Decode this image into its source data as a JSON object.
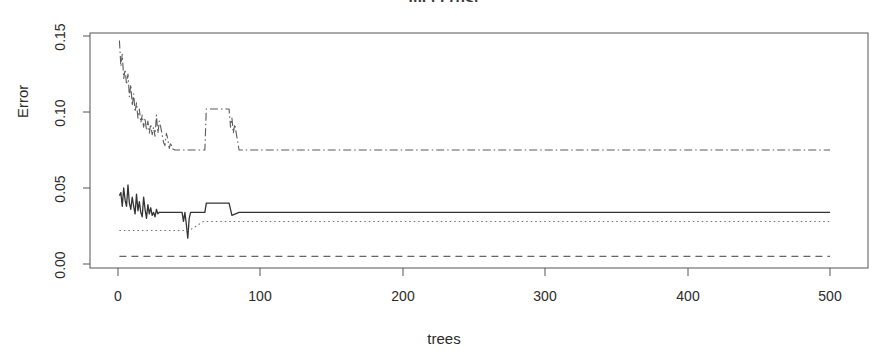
{
  "chart_data": {
    "type": "line",
    "title": "mcl.crbst",
    "xlabel": "trees",
    "ylabel": "Error",
    "xlim": [
      0,
      500
    ],
    "ylim": [
      0.0,
      0.155
    ],
    "xticks": [
      0,
      100,
      200,
      300,
      400,
      500
    ],
    "xtick_labels": [
      "0",
      "100",
      "200",
      "300",
      "400",
      "500"
    ],
    "yticks": [
      0.0,
      0.05,
      0.1,
      0.15
    ],
    "ytick_labels": [
      "0.00",
      "0.05",
      "0.10",
      "0.15"
    ],
    "grid": false,
    "legend": "none",
    "box": true,
    "series": [
      {
        "name": "OOB",
        "style": "solid",
        "color": "#333333",
        "x": [
          1,
          2,
          3,
          4,
          5,
          6,
          7,
          8,
          9,
          10,
          11,
          12,
          13,
          14,
          15,
          16,
          17,
          18,
          19,
          20,
          21,
          22,
          23,
          24,
          25,
          26,
          27,
          28,
          29,
          30,
          31,
          32,
          33,
          34,
          35,
          36,
          37,
          38,
          39,
          40,
          41,
          42,
          43,
          44,
          45,
          46,
          47,
          48,
          49,
          50,
          51,
          52,
          53,
          54,
          55,
          56,
          57,
          58,
          59,
          60,
          61,
          62,
          63,
          64,
          65,
          66,
          67,
          68,
          69,
          70,
          72,
          74,
          76,
          78,
          80,
          85,
          90,
          100,
          120,
          150,
          200,
          250,
          300,
          350,
          400,
          450,
          500
        ],
        "values": [
          0.045,
          0.047,
          0.038,
          0.05,
          0.042,
          0.038,
          0.052,
          0.04,
          0.036,
          0.044,
          0.038,
          0.033,
          0.046,
          0.035,
          0.041,
          0.034,
          0.031,
          0.044,
          0.036,
          0.03,
          0.039,
          0.033,
          0.037,
          0.032,
          0.034,
          0.031,
          0.036,
          0.033,
          0.034,
          0.034,
          0.034,
          0.034,
          0.034,
          0.034,
          0.034,
          0.034,
          0.034,
          0.034,
          0.034,
          0.034,
          0.034,
          0.034,
          0.034,
          0.034,
          0.034,
          0.028,
          0.034,
          0.026,
          0.017,
          0.03,
          0.034,
          0.034,
          0.034,
          0.034,
          0.034,
          0.034,
          0.034,
          0.034,
          0.034,
          0.034,
          0.034,
          0.04,
          0.04,
          0.04,
          0.04,
          0.04,
          0.04,
          0.04,
          0.04,
          0.04,
          0.04,
          0.04,
          0.04,
          0.04,
          0.032,
          0.034,
          0.034,
          0.034,
          0.034,
          0.034,
          0.034,
          0.034,
          0.034,
          0.034,
          0.034,
          0.034,
          0.034
        ]
      },
      {
        "name": "class-1-error",
        "style": "dashed",
        "color": "#666666",
        "x": [
          1,
          10,
          25,
          50,
          75,
          100,
          150,
          200,
          250,
          300,
          350,
          400,
          450,
          500
        ],
        "values": [
          0.005,
          0.005,
          0.005,
          0.005,
          0.005,
          0.005,
          0.005,
          0.005,
          0.005,
          0.005,
          0.005,
          0.005,
          0.005,
          0.005
        ]
      },
      {
        "name": "class-2-error",
        "style": "dotted",
        "color": "#707070",
        "x": [
          1,
          5,
          10,
          15,
          20,
          25,
          30,
          35,
          40,
          45,
          50,
          60,
          75,
          100,
          150,
          200,
          250,
          300,
          350,
          400,
          450,
          500
        ],
        "values": [
          0.022,
          0.022,
          0.022,
          0.022,
          0.022,
          0.022,
          0.022,
          0.022,
          0.022,
          0.022,
          0.022,
          0.028,
          0.028,
          0.028,
          0.028,
          0.028,
          0.028,
          0.028,
          0.028,
          0.028,
          0.028,
          0.028
        ]
      },
      {
        "name": "class-3-error",
        "style": "dashdot",
        "color": "#5a5a5a",
        "x": [
          1,
          2,
          3,
          4,
          5,
          6,
          7,
          8,
          9,
          10,
          11,
          12,
          13,
          14,
          15,
          16,
          17,
          18,
          19,
          20,
          21,
          22,
          23,
          24,
          25,
          26,
          27,
          28,
          29,
          30,
          31,
          32,
          33,
          34,
          35,
          36,
          37,
          38,
          40,
          42,
          44,
          46,
          48,
          50,
          55,
          60,
          61,
          62,
          63,
          64,
          66,
          68,
          70,
          72,
          74,
          76,
          78,
          79,
          80,
          81,
          82,
          85,
          90,
          100,
          150,
          200,
          250,
          300,
          350,
          400,
          450,
          500
        ],
        "values": [
          0.147,
          0.13,
          0.138,
          0.122,
          0.128,
          0.118,
          0.125,
          0.11,
          0.118,
          0.104,
          0.112,
          0.1,
          0.106,
          0.096,
          0.102,
          0.093,
          0.098,
          0.09,
          0.096,
          0.088,
          0.094,
          0.086,
          0.092,
          0.085,
          0.09,
          0.084,
          0.098,
          0.086,
          0.094,
          0.09,
          0.085,
          0.08,
          0.078,
          0.086,
          0.082,
          0.076,
          0.08,
          0.076,
          0.075,
          0.075,
          0.075,
          0.075,
          0.075,
          0.075,
          0.075,
          0.075,
          0.075,
          0.102,
          0.102,
          0.102,
          0.102,
          0.102,
          0.102,
          0.102,
          0.102,
          0.102,
          0.102,
          0.09,
          0.096,
          0.086,
          0.092,
          0.075,
          0.075,
          0.075,
          0.075,
          0.075,
          0.075,
          0.075,
          0.075,
          0.075,
          0.075,
          0.075
        ]
      }
    ]
  }
}
